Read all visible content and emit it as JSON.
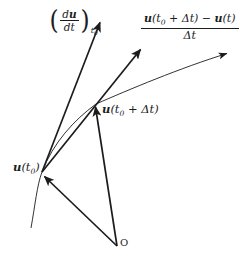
{
  "figure": {
    "background": "#ffffff",
    "ink": "#1c1c1c"
  },
  "labels": {
    "derivative": {
      "paren_open": "(",
      "num_d": "d",
      "num_u": "u",
      "denominator": "dt",
      "paren_close": ")",
      "sub_t": "t",
      "sub_0": "0"
    },
    "difference_quotient": {
      "numerator_parts": [
        {
          "t": "u"
        },
        {
          "t": "(t"
        },
        {
          "t": "0"
        },
        {
          "t": " + Δt) − "
        },
        {
          "t": "u"
        },
        {
          "t": "(t)"
        }
      ],
      "denominator": "Δt"
    },
    "u_t0_dt": {
      "parts": [
        {
          "t": "u"
        },
        {
          "t": "(t"
        },
        {
          "t": "0"
        },
        {
          "t": " + Δt)"
        }
      ]
    },
    "u_t0": {
      "parts": [
        {
          "t": "u"
        },
        {
          "t": "(t"
        },
        {
          "t": "0"
        },
        {
          "t": ")"
        }
      ]
    },
    "origin": "O"
  }
}
